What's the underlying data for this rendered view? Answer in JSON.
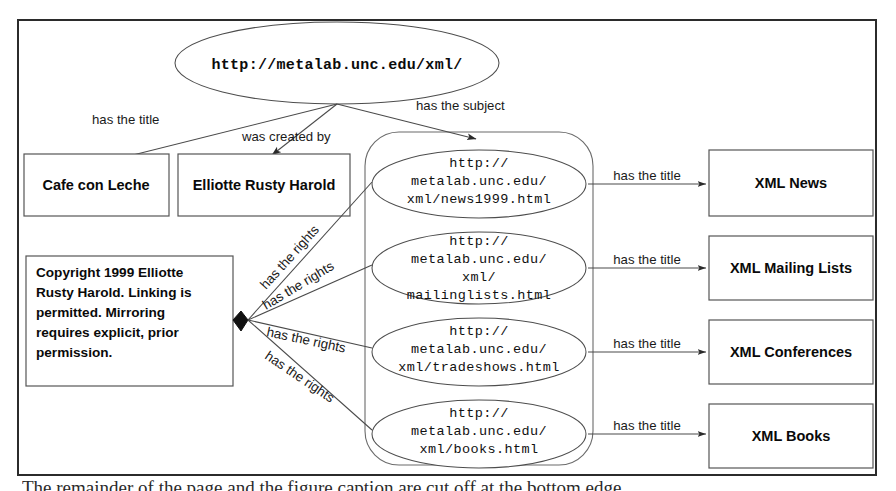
{
  "figure": {
    "type": "rdf-graph-diagram",
    "root_node": {
      "label": "http://metalab.unc.edu/xml/",
      "shape": "ellipse"
    },
    "root_edges": [
      {
        "label": "has the title",
        "target": "cafe-con-leche"
      },
      {
        "label": "was created by",
        "target": "elliotte-rusty-harold"
      },
      {
        "label": "has the subject",
        "target": "bag-container"
      }
    ],
    "literal_boxes": [
      {
        "id": "cafe-con-leche",
        "label": "Cafe con Leche"
      },
      {
        "id": "elliotte-rusty-harold",
        "label": "Elliotte Rusty Harold"
      }
    ],
    "rights_box": {
      "id": "copyright-box",
      "label": "Copyright 1999 Elliotte Rusty Harold. Linking is permitted. Mirroring requires explicit, prior permission.",
      "lines": [
        "Copyright 1999 Elliotte",
        "Rusty Harold. Linking is",
        "permitted. Mirroring",
        "requires explicit, prior",
        "permission."
      ]
    },
    "rights_edges": [
      {
        "label": "has the rights",
        "target": "news1999"
      },
      {
        "label": "has the rights",
        "target": "mailinglists"
      },
      {
        "label": "has the rights",
        "target": "tradeshows"
      },
      {
        "label": "has the rights",
        "target": "books"
      }
    ],
    "resources": [
      {
        "id": "news1999",
        "uri": "http://metalab.unc.edu/xml/news1999.html",
        "lines": [
          "http://",
          "metalab.unc.edu/",
          "xml/news1999.html"
        ],
        "title_edge_label": "has the title",
        "title": "XML News"
      },
      {
        "id": "mailinglists",
        "uri": "http://metalab.unc.edu/xml/mailinglists.html",
        "lines": [
          "http://",
          "metalab.unc.edu/",
          "xml/",
          "mailinglists.html"
        ],
        "title_edge_label": "has the title",
        "title": "XML Mailing Lists"
      },
      {
        "id": "tradeshows",
        "uri": "http://metalab.unc.edu/xml/tradeshows.html",
        "lines": [
          "http://",
          "metalab.unc.edu/",
          "xml/tradeshows.html"
        ],
        "title_edge_label": "has the title",
        "title": "XML Conferences"
      },
      {
        "id": "books",
        "uri": "http://metalab.unc.edu/xml/books.html",
        "lines": [
          "http://",
          "metalab.unc.edu/",
          "xml/books.html"
        ],
        "title_edge_label": "has the title",
        "title": "XML Books"
      }
    ],
    "colors": {
      "frame": "#2b2b2b",
      "node_stroke": "#4d4d4d",
      "text": "#0a0a0a",
      "background": "#ffffff"
    }
  },
  "caption": {
    "clipped_text": "The remainder of the page and the figure caption are cut off at the bottom edge"
  }
}
